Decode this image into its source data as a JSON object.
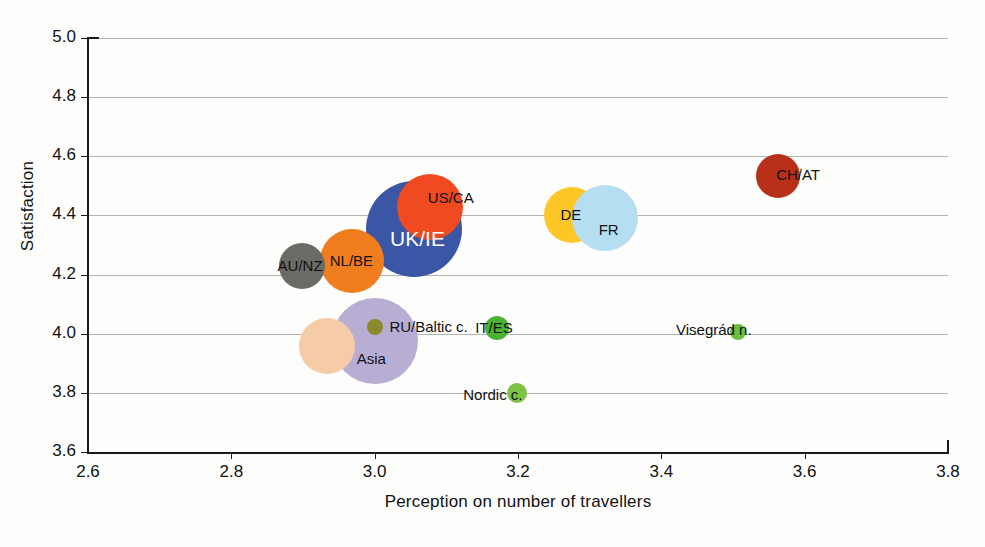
{
  "chart_data": {
    "type": "scatter",
    "title": "",
    "xlabel": "Perception on number of travellers",
    "ylabel": "Satisfaction",
    "xlim": [
      2.6,
      3.8
    ],
    "ylim": [
      3.6,
      5.0
    ],
    "xticks": [
      "2.6",
      "2.8",
      "3.0",
      "3.2",
      "3.4",
      "3.6",
      "3.8"
    ],
    "yticks": [
      "3.6",
      "3.8",
      "4.0",
      "4.2",
      "4.4",
      "4.6",
      "4.8",
      "5.0"
    ],
    "grid": "horizontal",
    "legend": "none",
    "bubbles": [
      {
        "label": "UK/IE",
        "x": 3.055,
        "y": 4.355,
        "r": 48,
        "color": "#3a56a5",
        "label_color": "#ffffff",
        "label_size": "big",
        "label_dx": -24,
        "label_dy": 12
      },
      {
        "label": "US/CA",
        "x": 3.077,
        "y": 4.43,
        "r": 33,
        "color": "#f04a20",
        "label_color": "#111111",
        "label_size": "small",
        "label_dx": -2,
        "label_dy": -8
      },
      {
        "label": "NL/BE",
        "x": 2.968,
        "y": 4.245,
        "r": 32,
        "color": "#f07d1e",
        "label_color": "#111111",
        "label_size": "small",
        "label_dx": -22,
        "label_dy": 1
      },
      {
        "label": "AU/NZ",
        "x": 2.898,
        "y": 4.228,
        "r": 23,
        "color": "#6b6b66",
        "label_color": "#111111",
        "label_size": "small",
        "label_dx": -24,
        "label_dy": 1
      },
      {
        "label": "Asia",
        "x": 3.0,
        "y": 3.975,
        "r": 43,
        "color": "#b8aed4",
        "label_color": "#111111",
        "label_size": "small",
        "label_dx": -18,
        "label_dy": 19
      },
      {
        "label": "",
        "x": 2.933,
        "y": 3.958,
        "r": 28,
        "color": "#f5cba8",
        "label_color": "#111111",
        "label_size": "small",
        "label_dx": 0,
        "label_dy": 0
      },
      {
        "label": "RU/Baltic c.",
        "x": 3.001,
        "y": 4.022,
        "r": 8,
        "color": "#8a8a2a",
        "label_color": "#111111",
        "label_size": "small",
        "label_dx": 14,
        "label_dy": 1
      },
      {
        "label": "IT/ES",
        "x": 3.171,
        "y": 4.018,
        "r": 12,
        "color": "#4cb233",
        "label_color": "#111111",
        "label_size": "small",
        "label_dx": -22,
        "label_dy": 1
      },
      {
        "label": "Nordic c.",
        "x": 3.199,
        "y": 3.8,
        "r": 10,
        "color": "#7dc242",
        "label_color": "#111111",
        "label_size": "small",
        "label_dx": -54,
        "label_dy": 3
      },
      {
        "label": "Visegrád n.",
        "x": 3.507,
        "y": 4.005,
        "r": 8,
        "color": "#6bbf3f",
        "label_color": "#111111",
        "label_size": "small",
        "label_dx": -62,
        "label_dy": -1
      },
      {
        "label": "DE",
        "x": 3.276,
        "y": 4.4,
        "r": 28,
        "color": "#fdc827",
        "label_color": "#111111",
        "label_size": "small",
        "label_dx": -12,
        "label_dy": 1
      },
      {
        "label": "FR",
        "x": 3.321,
        "y": 4.39,
        "r": 33,
        "color": "#b5dff0",
        "label_color": "#111111",
        "label_size": "small",
        "label_dx": -6,
        "label_dy": 13
      },
      {
        "label": "CH/AT",
        "x": 3.563,
        "y": 4.535,
        "r": 22,
        "color": "#b8301a",
        "label_color": "#111111",
        "label_size": "small",
        "label_dx": -2,
        "label_dy": 0
      }
    ]
  }
}
